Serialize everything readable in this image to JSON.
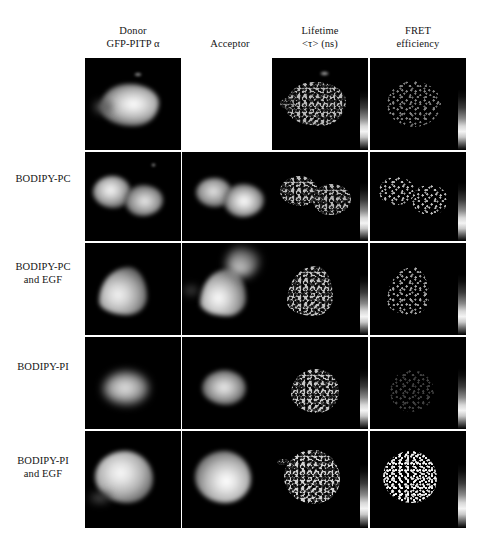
{
  "figure": {
    "background_color": "#ffffff",
    "panel_background_color": "#000000",
    "grid_rows": 5,
    "grid_columns": 4
  },
  "columns": [
    {
      "id": "donor",
      "line1": "Donor",
      "line2": "GFP-PITP α"
    },
    {
      "id": "acceptor",
      "line1": "Acceptor",
      "line2": ""
    },
    {
      "id": "lifetime",
      "line1": "Lifetime",
      "line2": "<τ> (ns)"
    },
    {
      "id": "fret",
      "line1": "FRET",
      "line2": "efficiency"
    }
  ],
  "rows": [
    {
      "id": "control",
      "line1": "",
      "line2": ""
    },
    {
      "id": "bodipy-pc",
      "line1": "BODIPY-PC",
      "line2": ""
    },
    {
      "id": "bodipy-pc-egf",
      "line1": "BODIPY-PC",
      "line2": "and EGF"
    },
    {
      "id": "bodipy-pi",
      "line1": "BODIPY-PI",
      "line2": ""
    },
    {
      "id": "bodipy-pi-egf",
      "line1": "BODIPY-PI",
      "line2": "and EGF"
    }
  ],
  "panels": {
    "r1c1": {
      "kind": "donor",
      "present": true,
      "label": "donor-control"
    },
    "r1c2": {
      "kind": "empty",
      "present": false,
      "label": "acceptor-control-absent"
    },
    "r1c3": {
      "kind": "lifetime",
      "present": true,
      "label": "lifetime-control"
    },
    "r1c4": {
      "kind": "fret",
      "present": true,
      "label": "fret-control"
    },
    "r2c1": {
      "kind": "donor",
      "present": true,
      "label": "donor-bodipy-pc"
    },
    "r2c2": {
      "kind": "acceptor",
      "present": true,
      "label": "acceptor-bodipy-pc"
    },
    "r2c3": {
      "kind": "lifetime",
      "present": true,
      "label": "lifetime-bodipy-pc"
    },
    "r2c4": {
      "kind": "fret",
      "present": true,
      "label": "fret-bodipy-pc"
    },
    "r3c1": {
      "kind": "donor",
      "present": true,
      "label": "donor-bodipy-pc-egf"
    },
    "r3c2": {
      "kind": "acceptor",
      "present": true,
      "label": "acceptor-bodipy-pc-egf"
    },
    "r3c3": {
      "kind": "lifetime",
      "present": true,
      "label": "lifetime-bodipy-pc-egf"
    },
    "r3c4": {
      "kind": "fret",
      "present": true,
      "label": "fret-bodipy-pc-egf"
    },
    "r4c1": {
      "kind": "donor",
      "present": true,
      "label": "donor-bodipy-pi"
    },
    "r4c2": {
      "kind": "acceptor",
      "present": true,
      "label": "acceptor-bodipy-pi"
    },
    "r4c3": {
      "kind": "lifetime",
      "present": true,
      "label": "lifetime-bodipy-pi"
    },
    "r4c4": {
      "kind": "fret",
      "present": true,
      "label": "fret-bodipy-pi"
    },
    "r5c1": {
      "kind": "donor",
      "present": true,
      "label": "donor-bodipy-pi-egf"
    },
    "r5c2": {
      "kind": "acceptor",
      "present": true,
      "label": "acceptor-bodipy-pi-egf"
    },
    "r5c3": {
      "kind": "lifetime",
      "present": true,
      "label": "lifetime-bodipy-pi-egf"
    },
    "r5c4": {
      "kind": "fret",
      "present": true,
      "label": "fret-bodipy-pi-egf"
    }
  },
  "colorbar": {
    "present_in_columns": [
      "lifetime",
      "fret"
    ],
    "orientation": "vertical",
    "low_color": "#000000",
    "high_color": "#ffffff"
  }
}
